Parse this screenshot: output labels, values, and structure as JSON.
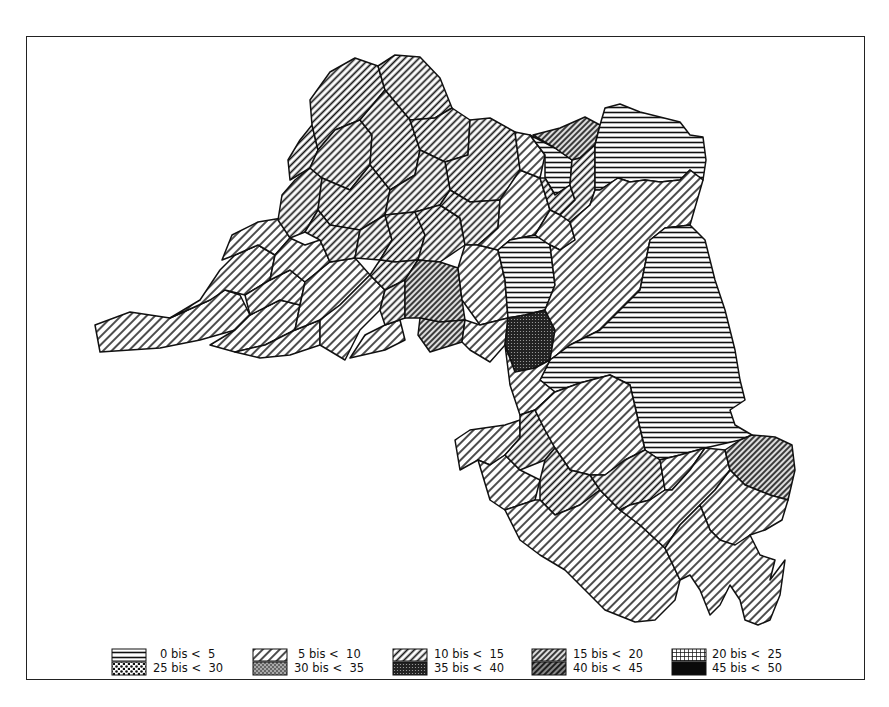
{
  "map": {
    "type": "choropleth",
    "style": "black-and-white hatch patterns"
  },
  "legend": {
    "items": [
      {
        "label": "0 bis <  5",
        "pattern": "horizontal",
        "row": 0,
        "col": 0
      },
      {
        "label": "5 bis <  10",
        "pattern": "diag-light",
        "row": 0,
        "col": 1
      },
      {
        "label": "10 bis <  15",
        "pattern": "diag-medium",
        "row": 0,
        "col": 2
      },
      {
        "label": "15 bis <  20",
        "pattern": "diag-dense",
        "row": 0,
        "col": 3
      },
      {
        "label": "20 bis <  25",
        "pattern": "grid",
        "row": 0,
        "col": 4
      },
      {
        "label": "25 bis <  30",
        "pattern": "dots-light",
        "row": 1,
        "col": 0
      },
      {
        "label": "30 bis <  35",
        "pattern": "dots-medium",
        "row": 1,
        "col": 1
      },
      {
        "label": "35 bis <  40",
        "pattern": "dots-dense",
        "row": 1,
        "col": 2
      },
      {
        "label": "40 bis <  45",
        "pattern": "diag-dark",
        "row": 1,
        "col": 3
      },
      {
        "label": "45 bis <  50",
        "pattern": "solid",
        "row": 1,
        "col": 4
      }
    ]
  },
  "colors": {
    "ink": "#111111",
    "paper": "#ffffff"
  }
}
